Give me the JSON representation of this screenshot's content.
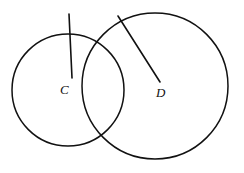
{
  "figure": {
    "background_color": "#ffffff",
    "stroke_color": "#111111",
    "width": 244,
    "height": 173,
    "labels": {
      "center_left": "C",
      "center_right": "D"
    },
    "circles": [
      {
        "name": "circle-C",
        "cx": 68,
        "cy": 90,
        "r": 56,
        "stroke_width": 1.5
      },
      {
        "name": "circle-D",
        "cx": 155,
        "cy": 86,
        "r": 73,
        "stroke_width": 1.6
      }
    ],
    "lines": [
      {
        "name": "arc-line-to-C",
        "x1": 69,
        "y1": 14,
        "x2": 72,
        "y2": 78,
        "stroke_width": 1.6
      },
      {
        "name": "arc-line-to-D",
        "x1": 118,
        "y1": 16,
        "x2": 160,
        "y2": 82,
        "stroke_width": 1.6
      }
    ]
  }
}
